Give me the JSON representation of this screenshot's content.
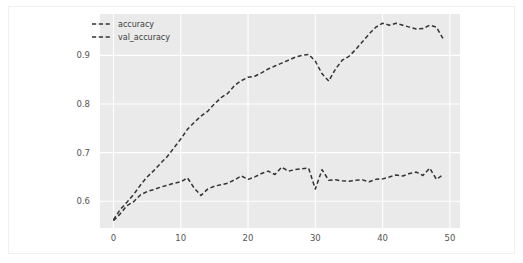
{
  "chart_data": {
    "type": "line",
    "title": "",
    "xlabel": "",
    "ylabel": "",
    "xlim": [
      -2.0,
      51.5
    ],
    "ylim": [
      0.545,
      0.985
    ],
    "xticks": [
      0,
      10,
      20,
      30,
      40,
      50
    ],
    "xtick_labels": [
      "0",
      "10",
      "20",
      "30",
      "40",
      "50"
    ],
    "yticks": [
      0.6,
      0.7,
      0.8,
      0.9
    ],
    "ytick_labels": [
      "0.6",
      "0.7",
      "0.8",
      "0.9"
    ],
    "grid": true,
    "grid_color": "#ffffff",
    "plot_bgcolor": "#eaeaea",
    "figure_bgcolor": "#ffffff",
    "legend_position": "upper left",
    "linestyle": "dashed",
    "x": [
      0,
      1,
      2,
      3,
      4,
      5,
      6,
      7,
      8,
      9,
      10,
      11,
      12,
      13,
      14,
      15,
      16,
      17,
      18,
      19,
      20,
      21,
      22,
      23,
      24,
      25,
      26,
      27,
      28,
      29,
      30,
      31,
      32,
      33,
      34,
      35,
      36,
      37,
      38,
      39,
      40,
      41,
      42,
      43,
      44,
      45,
      46,
      47,
      48,
      49
    ],
    "series": [
      {
        "name": "accuracy",
        "color": "#333333",
        "linestyle": "dashed",
        "values": [
          0.562,
          0.583,
          0.598,
          0.614,
          0.633,
          0.65,
          0.663,
          0.678,
          0.692,
          0.71,
          0.728,
          0.748,
          0.762,
          0.775,
          0.785,
          0.8,
          0.813,
          0.822,
          0.838,
          0.848,
          0.855,
          0.857,
          0.864,
          0.872,
          0.878,
          0.884,
          0.89,
          0.896,
          0.9,
          0.902,
          0.888,
          0.862,
          0.847,
          0.872,
          0.89,
          0.898,
          0.912,
          0.928,
          0.944,
          0.958,
          0.966,
          0.962,
          0.966,
          0.962,
          0.958,
          0.954,
          0.955,
          0.962,
          0.958,
          0.934
        ]
      },
      {
        "name": "val_accuracy",
        "color": "#333333",
        "linestyle": "dashed",
        "values": [
          0.56,
          0.574,
          0.591,
          0.599,
          0.613,
          0.62,
          0.624,
          0.629,
          0.633,
          0.637,
          0.64,
          0.648,
          0.627,
          0.612,
          0.625,
          0.631,
          0.634,
          0.637,
          0.644,
          0.652,
          0.645,
          0.65,
          0.657,
          0.662,
          0.655,
          0.67,
          0.662,
          0.665,
          0.667,
          0.668,
          0.625,
          0.665,
          0.643,
          0.644,
          0.642,
          0.641,
          0.643,
          0.644,
          0.64,
          0.645,
          0.646,
          0.65,
          0.654,
          0.652,
          0.657,
          0.66,
          0.653,
          0.668,
          0.645,
          0.655
        ]
      }
    ]
  }
}
